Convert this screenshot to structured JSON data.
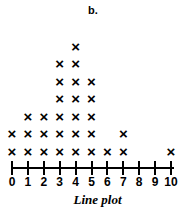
{
  "panel": {
    "letter": "b."
  },
  "caption": {
    "text": "Line plot"
  },
  "axis": {
    "tick_labels": [
      "0",
      "1",
      "2",
      "3",
      "4",
      "5",
      "6",
      "7",
      "8",
      "9",
      "10"
    ],
    "line_color": "#000000"
  },
  "marks": {
    "glyph": "×",
    "color": "#000000"
  },
  "chart_data": {
    "type": "bar",
    "title": "b.",
    "subtitle": "Line plot",
    "xlabel": "",
    "ylabel": "",
    "plot_style": "dot-plot-with-x-marks",
    "grid": false,
    "legend": null,
    "categories": [
      "0",
      "1",
      "2",
      "3",
      "4",
      "5",
      "6",
      "7",
      "8",
      "9",
      "10"
    ],
    "values": [
      2,
      3,
      3,
      6,
      7,
      5,
      1,
      2,
      0,
      0,
      1
    ],
    "xlim": [
      0,
      10
    ],
    "ylim": [
      0,
      7
    ],
    "total_marks": 30,
    "annotations": [
      "b.",
      "Line plot"
    ]
  }
}
